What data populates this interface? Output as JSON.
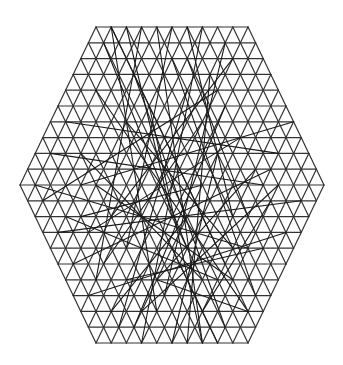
{
  "diagram": {
    "type": "hexagonal-triangular-lattice",
    "title": "",
    "background": "#ffffff",
    "stroke_color": "#333333",
    "grid_stroke_width": 1.2,
    "chord_stroke_width": 1.1,
    "chord_color": "#1a1a1a",
    "center": [
      172,
      185
    ],
    "hex_side_triangles": 10,
    "cell_dx": 15.2,
    "cell_dy": 15.8,
    "chords": [
      [
        [
          -10,
          -9
        ],
        [
          2,
          4
        ]
      ],
      [
        [
          -9,
          -10
        ],
        [
          -3,
          8
        ]
      ],
      [
        [
          -8,
          -10
        ],
        [
          6,
          5
        ]
      ],
      [
        [
          -6,
          -10
        ],
        [
          -1,
          2
        ]
      ],
      [
        [
          -4,
          -10
        ],
        [
          -10,
          6
        ]
      ],
      [
        [
          -2,
          -10
        ],
        [
          4,
          10
        ]
      ],
      [
        [
          0,
          -10
        ],
        [
          -6,
          4
        ]
      ],
      [
        [
          2,
          -10
        ],
        [
          8,
          2
        ]
      ],
      [
        [
          4,
          -10
        ],
        [
          -4,
          10
        ]
      ],
      [
        [
          6,
          -9
        ],
        [
          -2,
          7
        ]
      ],
      [
        [
          -14,
          -4
        ],
        [
          14,
          -2
        ]
      ],
      [
        [
          -16,
          -2
        ],
        [
          12,
          0
        ]
      ],
      [
        [
          -12,
          0
        ],
        [
          16,
          -4
        ]
      ],
      [
        [
          -18,
          0
        ],
        [
          10,
          4
        ]
      ],
      [
        [
          -15,
          3
        ],
        [
          17,
          1
        ]
      ],
      [
        [
          -13,
          5
        ],
        [
          13,
          -1
        ]
      ],
      [
        [
          -11,
          7
        ],
        [
          15,
          3
        ]
      ],
      [
        [
          -17,
          1
        ],
        [
          5,
          -6
        ]
      ],
      [
        [
          -10,
          -6
        ],
        [
          9,
          8
        ]
      ],
      [
        [
          -8,
          2
        ],
        [
          8,
          -8
        ]
      ],
      [
        [
          -5,
          -7
        ],
        [
          7,
          9
        ]
      ],
      [
        [
          -3,
          -5
        ],
        [
          3,
          10
        ]
      ],
      [
        [
          -1,
          -8
        ],
        [
          11,
          7
        ]
      ],
      [
        [
          1,
          -6
        ],
        [
          -7,
          9
        ]
      ],
      [
        [
          3,
          -4
        ],
        [
          -9,
          5
        ]
      ],
      [
        [
          5,
          -7
        ],
        [
          1,
          10
        ]
      ],
      [
        [
          7,
          -5
        ],
        [
          -5,
          9
        ]
      ],
      [
        [
          9,
          -3
        ],
        [
          -11,
          3
        ]
      ],
      [
        [
          11,
          -1
        ],
        [
          -3,
          6
        ]
      ],
      [
        [
          13,
          1
        ],
        [
          3,
          8
        ]
      ],
      [
        [
          -6,
          6
        ],
        [
          12,
          4
        ]
      ],
      [
        [
          -4,
          8
        ],
        [
          14,
          0
        ]
      ],
      [
        [
          -2,
          6
        ],
        [
          10,
          8
        ]
      ],
      [
        [
          0,
          4
        ],
        [
          6,
          10
        ]
      ],
      [
        [
          2,
          2
        ],
        [
          -8,
          8
        ]
      ],
      [
        [
          4,
          0
        ],
        [
          -12,
          2
        ]
      ],
      [
        [
          6,
          -2
        ],
        [
          0,
          10
        ]
      ],
      [
        [
          8,
          6
        ],
        [
          -10,
          0
        ]
      ],
      [
        [
          10,
          2
        ],
        [
          2,
          -8
        ]
      ],
      [
        [
          -6,
          -4
        ],
        [
          8,
          4
        ]
      ],
      [
        [
          -14,
          2
        ],
        [
          6,
          6
        ]
      ],
      [
        [
          -12,
          -2
        ],
        [
          4,
          6
        ]
      ]
    ]
  }
}
